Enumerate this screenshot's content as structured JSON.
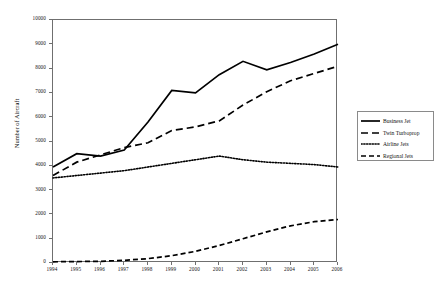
{
  "chart_data": {
    "type": "line",
    "title": "",
    "xlabel": "",
    "ylabel": "Number of Aircraft",
    "x": [
      1994,
      1995,
      1996,
      1997,
      1998,
      1999,
      2000,
      2001,
      2002,
      2003,
      2004,
      2005,
      2006
    ],
    "categories": [
      "1994",
      "1995",
      "1996",
      "1997",
      "1998",
      "1999",
      "2000",
      "2001",
      "2002",
      "2003",
      "2004",
      "2005",
      "2006"
    ],
    "xlim": [
      1994,
      2006
    ],
    "ylim": [
      0,
      10000
    ],
    "ytick_labels": [
      "0",
      "1000",
      "2000",
      "3000",
      "4000",
      "5000",
      "6000",
      "7000",
      "8000",
      "9000",
      "10000"
    ],
    "yticks": [
      0,
      1000,
      2000,
      3000,
      4000,
      5000,
      6000,
      7000,
      8000,
      9000,
      10000
    ],
    "grid": false,
    "legend_position": "right",
    "series": [
      {
        "name": "Business Jet",
        "style": "solid",
        "color": "#000000",
        "values": [
          3950,
          4500,
          4400,
          4650,
          5800,
          7100,
          7000,
          7750,
          8300,
          7950,
          8250,
          8600,
          9000
        ]
      },
      {
        "name": "Twin Turboprop",
        "style": "dashed-long",
        "color": "#000000",
        "values": [
          3600,
          4150,
          4450,
          4750,
          4950,
          5450,
          5600,
          5850,
          6500,
          7050,
          7500,
          7800,
          8100
        ]
      },
      {
        "name": "Airline Jets",
        "style": "dotted",
        "color": "#000000",
        "values": [
          3500,
          3600,
          3700,
          3800,
          3950,
          4100,
          4250,
          4400,
          4250,
          4150,
          4100,
          4050,
          3950
        ]
      },
      {
        "name": "Regional Jets",
        "style": "dashed",
        "color": "#000000",
        "values": [
          50,
          60,
          70,
          110,
          180,
          300,
          480,
          720,
          1000,
          1280,
          1530,
          1700,
          1790
        ]
      }
    ]
  },
  "legend": {
    "items": [
      {
        "label": "Business Jet"
      },
      {
        "label": "Twin Turboprop"
      },
      {
        "label": "Airline Jets"
      },
      {
        "label": "Regional Jets"
      }
    ]
  }
}
